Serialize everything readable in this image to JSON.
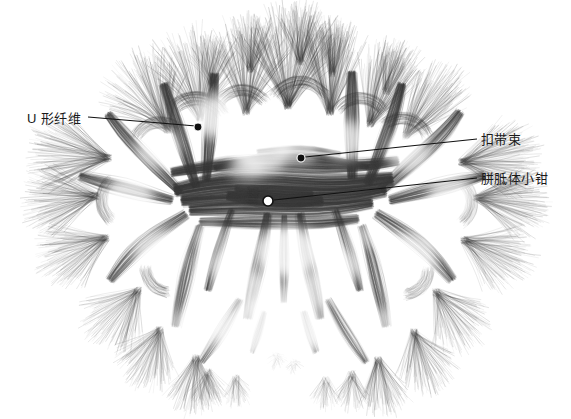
{
  "figure": {
    "kind": "dti-tractography-coronal-slice",
    "background_color": "#ffffff",
    "fiber_color": "#3b3b3b",
    "width": 571,
    "height": 419
  },
  "annotations": [
    {
      "id": "u-fiber",
      "label": "U 形纤维",
      "side": "left",
      "text_x": 27,
      "text_y": 112,
      "marker": {
        "x": 198,
        "y": 127,
        "style": "filled",
        "radius": 4
      },
      "leader": {
        "x1": 88,
        "y1": 117,
        "x2": 196,
        "y2": 126
      },
      "line_color": "#111111"
    },
    {
      "id": "cingulum",
      "label": "扣带束",
      "side": "right",
      "text_x": 481,
      "text_y": 133,
      "marker": {
        "x": 301,
        "y": 158,
        "style": "filled",
        "radius": 4
      },
      "leader": {
        "x1": 305,
        "y1": 157,
        "x2": 477,
        "y2": 139
      },
      "line_color": "#111111"
    },
    {
      "id": "forceps-minor",
      "label": "胼胝体小钳",
      "side": "right",
      "text_x": 481,
      "text_y": 172,
      "marker": {
        "x": 268,
        "y": 201,
        "style": "hollow",
        "radius": 5
      },
      "leader": {
        "x1": 274,
        "y1": 200,
        "x2": 477,
        "y2": 178
      },
      "line_color": "#111111"
    }
  ],
  "chart_data": {
    "type": "scatter",
    "title": "",
    "xlabel": "",
    "ylabel": "",
    "legend": [],
    "annotations_text": [
      "U 形纤维",
      "扣带束",
      "胼胝体小钳"
    ]
  }
}
